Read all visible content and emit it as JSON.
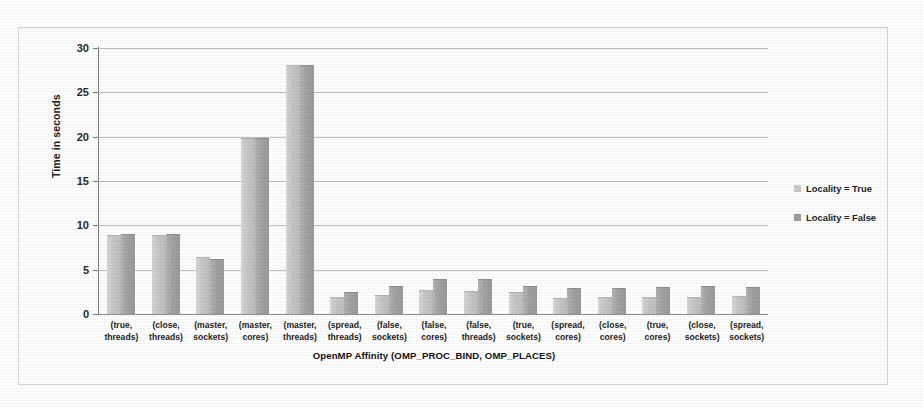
{
  "chart_data": {
    "type": "bar",
    "title": "",
    "xlabel": "OpenMP Affinity (OMP_PROC_BIND, OMP_PLACES)",
    "ylabel": "Time in seconds",
    "ylim": [
      0,
      30
    ],
    "yticks": [
      0,
      5,
      10,
      15,
      20,
      25,
      30
    ],
    "grid": true,
    "legend_position": "right",
    "categories": [
      "(true, threads)",
      "(close, threads)",
      "(master, sockets)",
      "(master, cores)",
      "(master, threads)",
      "(spread, threads)",
      "(false, sockets)",
      "(false, cores)",
      "(false, threads)",
      "(true, sockets)",
      "(spread, cores)",
      "(close, cores)",
      "(true, cores)",
      "(close, sockets)",
      "(spread, sockets)"
    ],
    "category_lines": [
      [
        "(true,",
        "threads)"
      ],
      [
        "(close,",
        "threads)"
      ],
      [
        "(master,",
        "sockets)"
      ],
      [
        "(master,",
        "cores)"
      ],
      [
        "(master,",
        "threads)"
      ],
      [
        "(spread,",
        "threads)"
      ],
      [
        "(false,",
        "sockets)"
      ],
      [
        "(false,",
        "cores)"
      ],
      [
        "(false,",
        "threads)"
      ],
      [
        "(true,",
        "sockets)"
      ],
      [
        "(spread,",
        "cores)"
      ],
      [
        "(close,",
        "cores)"
      ],
      [
        "(true,",
        "cores)"
      ],
      [
        "(close,",
        "sockets)"
      ],
      [
        "(spread,",
        "sockets)"
      ]
    ],
    "series": [
      {
        "name": "Locality = True",
        "color": "#cbcbcb",
        "values": [
          8.8,
          8.8,
          6.3,
          19.7,
          28.0,
          1.8,
          2.0,
          2.6,
          2.5,
          2.4,
          1.7,
          1.8,
          1.8,
          1.8,
          1.9
        ]
      },
      {
        "name": "Locality = False",
        "color": "#9c9c9c",
        "values": [
          8.9,
          8.9,
          6.1,
          19.7,
          28.0,
          2.4,
          3.0,
          3.8,
          3.8,
          3.0,
          2.8,
          2.8,
          2.9,
          3.0,
          2.9
        ]
      }
    ]
  },
  "legend": {
    "items": [
      {
        "label": "Locality = True",
        "swatch": "s-true"
      },
      {
        "label": "Locality = False",
        "swatch": "s-false"
      }
    ]
  }
}
